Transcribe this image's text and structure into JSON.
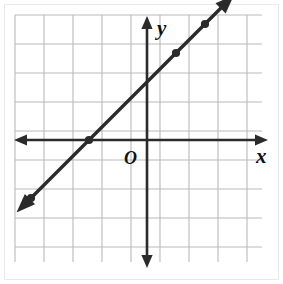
{
  "figure": {
    "background_color": "#ffffff",
    "border_color": "#e2e2e2"
  },
  "grid": {
    "line_color": "#b9b9b9",
    "cell_size_px": 29,
    "columns": 8,
    "rows": 8,
    "origin_x_px": 147,
    "origin_y_px": 140,
    "left_px": 15,
    "top_px": 15,
    "right_px": 262,
    "bottom_px": 262
  },
  "axes": {
    "color": "#2b2b2b",
    "x_label": "x",
    "y_label": "y",
    "origin_label": "O",
    "x_axis_y_px": 140,
    "y_axis_x_px": 147,
    "x_arrow_left_px": 14,
    "x_arrow_right_px": 268,
    "y_arrow_top_px": 16,
    "y_arrow_bottom_px": 268
  },
  "chart_data": {
    "type": "line",
    "xlabel": "x",
    "ylabel": "y",
    "grid": true,
    "legend": "none",
    "xlim": [
      -4.5,
      4
    ],
    "ylim": [
      -4.3,
      4.3
    ],
    "gridline_spacing": 1,
    "origin_label": "O",
    "series": [
      {
        "name": "line",
        "equation": "y = x + 2",
        "slope": 1,
        "y_intercept": 2,
        "x_intercept": -2,
        "color": "#2b2b2b",
        "arrows": "both",
        "x": [
          -4.5,
          3
        ],
        "y": [
          -2.5,
          5
        ],
        "points": [
          {
            "x": -4,
            "y": -2
          },
          {
            "x": -2,
            "y": 0
          },
          {
            "x": 1,
            "y": 3
          },
          {
            "x": 2,
            "y": 4
          }
        ]
      }
    ]
  }
}
